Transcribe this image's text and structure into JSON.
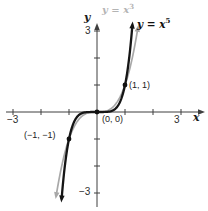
{
  "figure": {
    "background": "#ffffff",
    "axis_color": "#3f3f3f",
    "text_color": "#1c1c1c"
  },
  "chart_data": {
    "type": "line",
    "title": "",
    "xlabel": "x",
    "ylabel": "y",
    "xlim": [
      -3.3,
      3.6
    ],
    "ylim": [
      -3.4,
      3.4
    ],
    "grid": false,
    "x_ticks": [
      -3,
      -2,
      -1,
      1,
      2,
      3
    ],
    "y_ticks": [
      -3,
      -2,
      -1,
      1,
      2,
      3
    ],
    "tick_labels": {
      "x_left": "−3",
      "x_right": "3",
      "y_top": "3",
      "y_bottom": "−3"
    },
    "series": [
      {
        "name": "y = x^3",
        "label_base": "y = x",
        "label_sup": "3",
        "exponent": 3,
        "color": "#a8a8a8",
        "width": 1.7,
        "x_range": [
          -1.455,
          1.455
        ],
        "key_points": [
          [
            -1,
            -1
          ],
          [
            0,
            0
          ],
          [
            1,
            1
          ]
        ]
      },
      {
        "name": "y = x^5",
        "label_base": "y = x",
        "label_sup": "5",
        "exponent": 5,
        "color": "#151515",
        "width": 2.3,
        "x_range": [
          -1.262,
          1.262
        ],
        "key_points": [
          [
            -1,
            -1
          ],
          [
            0,
            0
          ],
          [
            1,
            1
          ]
        ]
      }
    ],
    "points": [
      {
        "x": 1,
        "y": 1,
        "label": "(1, 1)"
      },
      {
        "x": 0,
        "y": 0,
        "label": "(0, 0)"
      },
      {
        "x": -1,
        "y": -1,
        "label": "(−1, −1)"
      }
    ],
    "legend_position": "none"
  }
}
